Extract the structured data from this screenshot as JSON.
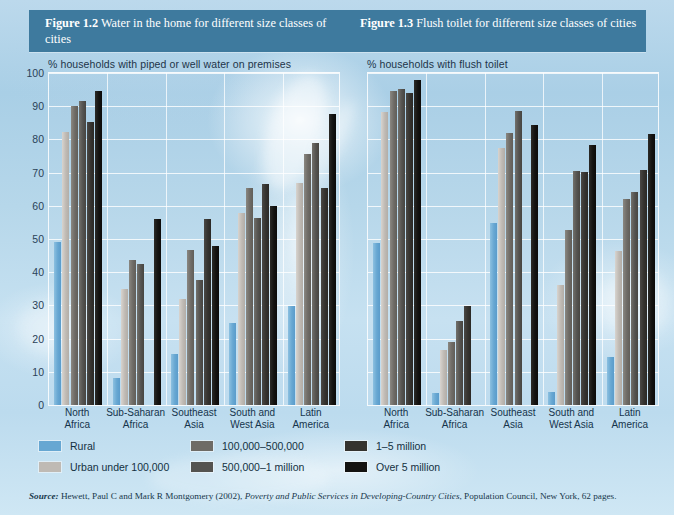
{
  "header": {
    "left": {
      "figure": "Figure 1.2",
      "title": "Water in the home for different size classes of cities"
    },
    "right": {
      "figure": "Figure 1.3",
      "title": "Flush toilet for different size classes of cities"
    },
    "band_color": "#3e7a9e"
  },
  "legend": {
    "items": [
      {
        "label": "Rural",
        "color": "#67a7d2"
      },
      {
        "label": "Urban under 100,000",
        "color": "#bfbab4"
      },
      {
        "label": "100,000–500,000",
        "color": "#6e6b66"
      },
      {
        "label": "500,000–1 million",
        "color": "#545350"
      },
      {
        "label": "1–5 million",
        "color": "#35332f"
      },
      {
        "label": "Over 5 million",
        "color": "#141311"
      }
    ]
  },
  "source": {
    "lead": "Source:",
    "authors": " Hewett, Paul C and Mark R Montgomery (2002), ",
    "work": "Poverty and Public Services in Developing-Country Cities",
    "publisher": ", Population Council, New York, 62 pages."
  },
  "chart_data": [
    {
      "type": "bar",
      "title": "% households with piped or well water on premises",
      "xlabel": "",
      "ylabel": "",
      "ylim": [
        0,
        100
      ],
      "yticks": [
        0,
        10,
        20,
        30,
        40,
        50,
        60,
        70,
        80,
        90,
        100
      ],
      "grid": true,
      "legend_position": "below",
      "categories": [
        "North Africa",
        "Sub-Saharan Africa",
        "Southeast Asia",
        "South and West Asia",
        "Latin America"
      ],
      "series": [
        {
          "name": "Rural",
          "values": [
            49.0,
            8.0,
            15.4,
            24.8,
            29.7
          ]
        },
        {
          "name": "Urban under 100,000",
          "values": [
            82.3,
            35.0,
            32.0,
            57.7,
            66.8
          ]
        },
        {
          "name": "100,000–500,000",
          "values": [
            90.2,
            43.8,
            46.8,
            65.5,
            75.5
          ]
        },
        {
          "name": "500,000–1 million",
          "values": [
            91.6,
            42.5,
            37.8,
            56.4,
            78.9
          ]
        },
        {
          "name": "1–5 million",
          "values": [
            85.2,
            null,
            55.9,
            66.5,
            65.3
          ]
        },
        {
          "name": "Over 5 million",
          "values": [
            94.7,
            56.0,
            48.0,
            60.0,
            87.7
          ]
        }
      ]
    },
    {
      "type": "bar",
      "title": "% households with flush toilet",
      "xlabel": "",
      "ylabel": "",
      "ylim": [
        0,
        100
      ],
      "yticks": [
        0,
        10,
        20,
        30,
        40,
        50,
        60,
        70,
        80,
        90,
        100
      ],
      "grid": true,
      "legend_position": "below",
      "categories": [
        "North Africa",
        "Sub-Saharan Africa",
        "Southeast Asia",
        "South and West Asia",
        "Latin America"
      ],
      "series": [
        {
          "name": "Rural",
          "values": [
            48.7,
            3.5,
            54.9,
            4.0,
            14.4
          ]
        },
        {
          "name": "Urban under 100,000",
          "values": [
            88.2,
            16.6,
            77.5,
            36.1,
            46.3
          ]
        },
        {
          "name": "100,000–500,000",
          "values": [
            94.6,
            19.1,
            81.9,
            52.8,
            62.2
          ]
        },
        {
          "name": "500,000–1 million",
          "values": [
            95.3,
            25.4,
            88.5,
            70.4,
            64.1
          ]
        },
        {
          "name": "1–5 million",
          "values": [
            94.1,
            29.8,
            null,
            70.2,
            70.9
          ]
        },
        {
          "name": "Over 5 million",
          "values": [
            98.0,
            null,
            84.2,
            78.4,
            81.6
          ]
        }
      ]
    }
  ]
}
